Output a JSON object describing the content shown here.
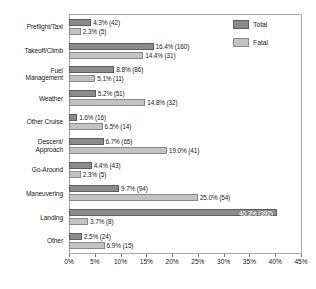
{
  "chart_data": {
    "type": "bar",
    "orientation": "horizontal",
    "title": "",
    "xlabel": "",
    "ylabel": "",
    "xlim": [
      0,
      45
    ],
    "xticks": [
      "0%",
      "5%",
      "10%",
      "15%",
      "20%",
      "25%",
      "30%",
      "35%",
      "40%",
      "45%"
    ],
    "xtick_values": [
      0,
      5,
      10,
      15,
      20,
      25,
      30,
      35,
      40,
      45
    ],
    "grid": false,
    "legend_position": "top-right",
    "categories": [
      "Preflight/Taxi",
      "Takeoff/Climb",
      "Fuel\nManagement",
      "Weather",
      "Other Cruise",
      "Descent/\nApproach",
      "Go-Around",
      "Maneuvering",
      "Landing",
      "Other"
    ],
    "series": [
      {
        "name": "Total",
        "color": "#8c8c8c",
        "values": [
          4.3,
          16.4,
          8.8,
          5.2,
          1.6,
          6.7,
          4.4,
          9.7,
          40.3,
          2.5
        ],
        "counts": [
          42,
          160,
          86,
          51,
          16,
          65,
          43,
          94,
          392,
          24
        ],
        "labels": [
          "4.3% (42)",
          "16.4% (160)",
          "8.8% (86)",
          "5.2% (51)",
          "1.6% (16)",
          "6.7% (65)",
          "4.4% (43)",
          "9.7% (94)",
          "40.3% (392)",
          "2.5% (24)"
        ],
        "label_inside": [
          false,
          false,
          false,
          false,
          false,
          false,
          false,
          false,
          true,
          false
        ]
      },
      {
        "name": "Fatal",
        "color": "#c3c3c3",
        "values": [
          2.3,
          14.4,
          5.1,
          14.8,
          6.5,
          19.0,
          2.3,
          25.0,
          3.7,
          6.9
        ],
        "counts": [
          5,
          31,
          11,
          32,
          14,
          41,
          5,
          54,
          8,
          15
        ],
        "labels": [
          "2.3% (5)",
          "14.4% (31)",
          "5.1% (11)",
          "14.8% (32)",
          "6.5% (14)",
          "19.0% (41)",
          "2.3% (5)",
          "25.0% (54)",
          "3.7% (8)",
          "6.9% (15)"
        ],
        "label_inside": [
          false,
          false,
          false,
          false,
          false,
          false,
          false,
          false,
          false,
          false
        ]
      }
    ]
  },
  "legend": {
    "items": [
      {
        "label": "Total",
        "color": "#8c8c8c"
      },
      {
        "label": "Fatal",
        "color": "#c3c3c3"
      }
    ]
  }
}
